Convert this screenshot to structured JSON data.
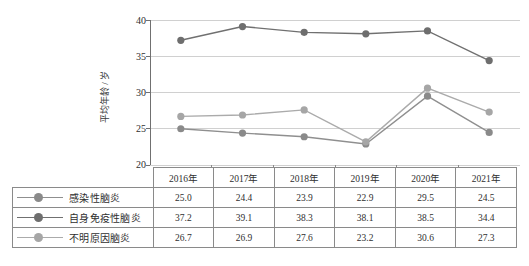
{
  "chart_data": {
    "type": "line",
    "title": "",
    "xlabel": "",
    "ylabel": "平均年龄 / 岁",
    "categories": [
      "2016年",
      "2017年",
      "2018年",
      "2019年",
      "2020年",
      "2021年"
    ],
    "ylim": [
      20,
      40
    ],
    "yticks": [
      20,
      25,
      30,
      35,
      40
    ],
    "grid": true,
    "legend_position": "table-below",
    "series": [
      {
        "name": "感染性脑炎",
        "values": [
          25.0,
          24.4,
          23.9,
          22.9,
          29.5,
          24.5
        ],
        "color": "#8f8f8f",
        "marker_color": "#8a8a8a"
      },
      {
        "name": "自身免疫性脑炎",
        "values": [
          37.2,
          39.1,
          38.3,
          38.1,
          38.5,
          34.4
        ],
        "color": "#707070",
        "marker_color": "#6e6e6e"
      },
      {
        "name": "不明原因脑炎",
        "values": [
          26.7,
          26.9,
          27.6,
          23.2,
          30.6,
          27.3
        ],
        "color": "#ababab",
        "marker_color": "#a6a6a6"
      }
    ]
  },
  "table": {
    "corner_label": "",
    "header": [
      "2016年",
      "2017年",
      "2018年",
      "2019年",
      "2020年",
      "2021年"
    ],
    "rows": [
      {
        "label": "感染性脑炎",
        "values": [
          "25.0",
          "24.4",
          "23.9",
          "22.9",
          "29.5",
          "24.5"
        ]
      },
      {
        "label": "自身免疫性脑炎",
        "values": [
          "37.2",
          "39.1",
          "38.3",
          "38.1",
          "38.5",
          "34.4"
        ]
      },
      {
        "label": "不明原因脑炎",
        "values": [
          "26.7",
          "26.9",
          "27.6",
          "23.2",
          "30.6",
          "27.3"
        ]
      }
    ]
  },
  "axis": {
    "ytick_labels": [
      "40",
      "35",
      "30",
      "25",
      "20"
    ],
    "y_title": "平均年龄 / 岁"
  },
  "colors": {
    "grid": "#d0d0d0",
    "axis": "#707070",
    "table_border": "#8a8a8a",
    "text": "#2f2f2f"
  }
}
